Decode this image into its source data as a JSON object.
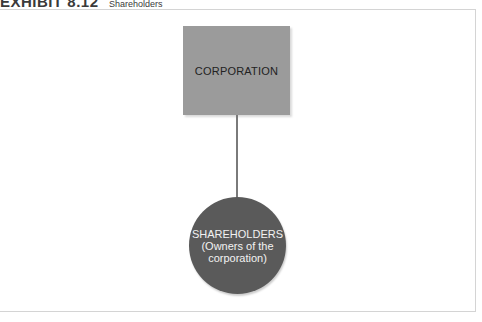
{
  "header": {
    "label": "EXHIBIT 8.12",
    "caption": "Shareholders"
  },
  "diagram": {
    "nodes": [
      {
        "id": "corporation",
        "shape": "rectangle",
        "label": "CORPORATION",
        "fill": "#9b9b9b"
      },
      {
        "id": "shareholders",
        "shape": "circle",
        "label": "SHAREHOLDERS",
        "sublabel_line1": "(Owners of the",
        "sublabel_line2": "corporation)",
        "fill": "#5a5a5a"
      }
    ],
    "edges": [
      {
        "from": "corporation",
        "to": "shareholders",
        "color": "#7a7a7a"
      }
    ]
  }
}
